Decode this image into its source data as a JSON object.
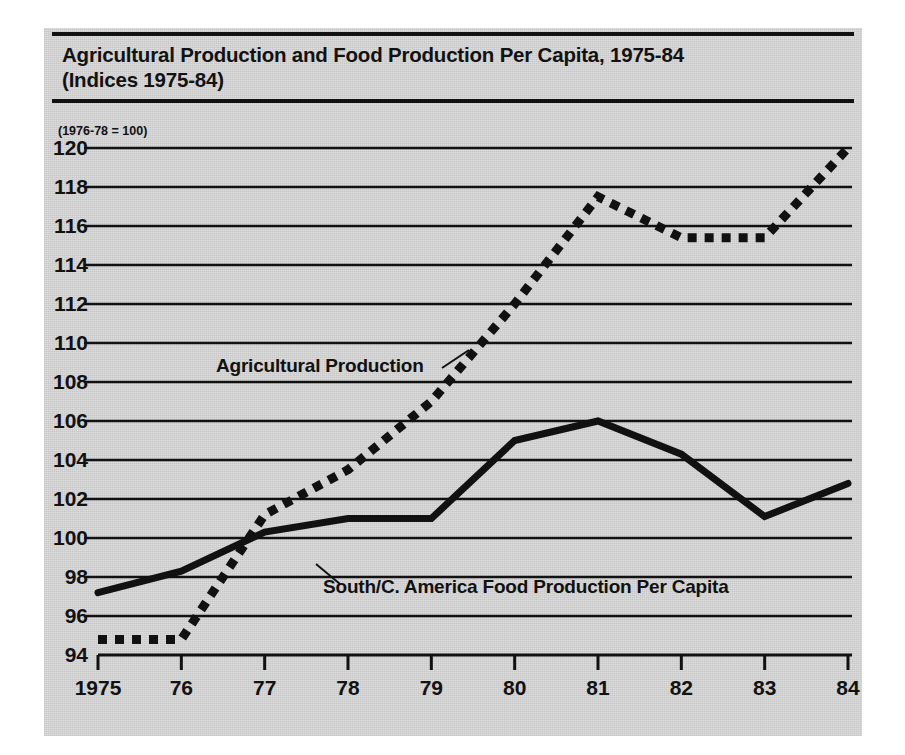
{
  "figure": {
    "title_line_1": "Agricultural Production and Food Production Per Capita, 1975-84",
    "title_line_2": "(Indices 1975-84)",
    "index_note": "(1976-78 = 100)",
    "panel_color": "#d9d9d9",
    "ink_color": "#111111"
  },
  "chart_data": {
    "type": "line",
    "title": "Agricultural Production and Food Production Per Capita, 1975-84",
    "subtitle": "(Indices 1975-84)",
    "annotation": "(1976-78 = 100)",
    "xlabel": "",
    "ylabel": "",
    "x": [
      1975,
      1976,
      1977,
      1978,
      1979,
      1980,
      1981,
      1982,
      1983,
      1984
    ],
    "xtick_labels": [
      "1975",
      "76",
      "77",
      "78",
      "79",
      "80",
      "81",
      "82",
      "83",
      "84"
    ],
    "ytick_labels": [
      "94",
      "96",
      "98",
      "100",
      "102",
      "104",
      "106",
      "108",
      "110",
      "112",
      "114",
      "116",
      "118",
      "120"
    ],
    "yticks": [
      94,
      96,
      98,
      100,
      102,
      104,
      106,
      108,
      110,
      112,
      114,
      116,
      118,
      120
    ],
    "ylim": [
      94,
      120
    ],
    "xlim": [
      1975,
      1984
    ],
    "grid": true,
    "legend": "inline-annotations",
    "series": [
      {
        "name": "Agricultural Production",
        "style": "dotted",
        "label_position": "inline",
        "values": [
          94.8,
          94.8,
          101.2,
          103.5,
          107.0,
          112.0,
          117.5,
          115.4,
          115.4,
          120.0
        ]
      },
      {
        "name": "South/C. America Food Production Per Capita",
        "style": "solid",
        "label_position": "inline",
        "values": [
          97.2,
          98.3,
          100.3,
          101.0,
          101.0,
          105.0,
          106.0,
          104.3,
          101.1,
          102.8
        ]
      }
    ]
  }
}
